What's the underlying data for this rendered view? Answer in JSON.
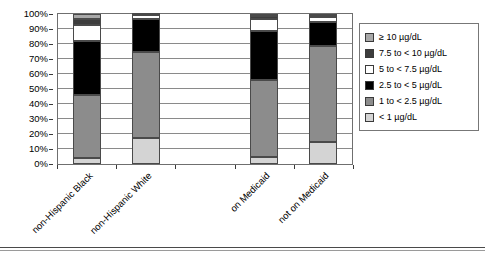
{
  "chart_data": {
    "type": "bar",
    "stacked": true,
    "title": "",
    "xlabel": "",
    "ylabel": "",
    "ylim": [
      0,
      100
    ],
    "ytick_labels": [
      "100%",
      "90%",
      "80%",
      "70%",
      "60%",
      "50%",
      "40%",
      "30%",
      "20%",
      "10%",
      "0%"
    ],
    "ytick_values": [
      100,
      90,
      80,
      70,
      60,
      50,
      40,
      30,
      20,
      10,
      0
    ],
    "grid": true,
    "legend_position": "right",
    "categories": [
      "non-Hispanic Black",
      "non-Hispanic White",
      "",
      "on Medicaid",
      "not on Medicaid"
    ],
    "series": [
      {
        "name": "< 1 µg/dL",
        "color": "#d4d4d4",
        "values": [
          4,
          17.5,
          null,
          5,
          15
        ]
      },
      {
        "name": "1 to < 2.5 µg/dL",
        "color": "#8c8c8c",
        "values": [
          42,
          57.5,
          null,
          51,
          64
        ]
      },
      {
        "name": "2.5 to < 5 µg/dL",
        "color": "#000000",
        "values": [
          36,
          22,
          null,
          33,
          16
        ]
      },
      {
        "name": "5 to < 7.5 µg/dL",
        "color": "#ffffff",
        "values": [
          11,
          2.5,
          null,
          8,
          3
        ]
      },
      {
        "name": "7.5 to < 10 µg/dL",
        "color": "#3d3d3d",
        "values": [
          4,
          0.5,
          null,
          2,
          1
        ]
      },
      {
        "name": "≥ 10 µg/dL",
        "color": "#a8a8a8",
        "values": [
          3,
          0,
          null,
          1,
          1
        ]
      }
    ],
    "legend_entries": [
      {
        "label": "≥ 10 µg/dL",
        "color": "#a8a8a8"
      },
      {
        "label": "7.5 to < 10 µg/dL",
        "color": "#3d3d3d"
      },
      {
        "label": "5 to < 7.5 µg/dL",
        "color": "#ffffff"
      },
      {
        "label": "2.5 to < 5 µg/dL",
        "color": "#000000"
      },
      {
        "label": "1 to < 2.5 µg/dL",
        "color": "#8c8c8c"
      },
      {
        "label": "< 1 µg/dL",
        "color": "#d4d4d4"
      }
    ]
  }
}
